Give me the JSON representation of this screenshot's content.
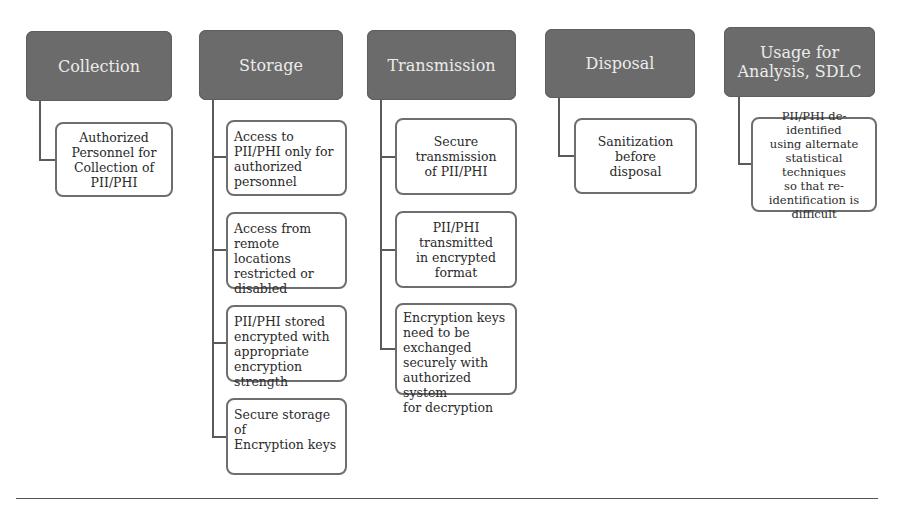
{
  "diagram": {
    "columns": [
      {
        "header": "Collection",
        "children": [
          "Authorized\nPersonnel for\nCollection of\nPII/PHI"
        ]
      },
      {
        "header": "Storage",
        "children": [
          "Access to\nPII/PHI only for\nauthorized\npersonnel",
          "Access from\nremote locations\nrestricted or\ndisabled",
          "PII/PHI stored\nencrypted with\nappropriate\nencryption\nstrength",
          "Secure storage of\nEncryption keys"
        ]
      },
      {
        "header": "Transmission",
        "children": [
          "Secure\ntransmission\nof PII/PHI",
          "PII/PHI\ntransmitted\nin encrypted\nformat",
          "Encryption keys\nneed to be\nexchanged\nsecurely with\nauthorized system\nfor decryption"
        ]
      },
      {
        "header": "Disposal",
        "children": [
          "Sanitization\nbefore\ndisposal"
        ]
      },
      {
        "header": "Usage for\nAnalysis, SDLC",
        "children": [
          "PII/PHI de-identified\nusing alternate\nstatistical techniques\nso that re-\nidentification is\ndifficult"
        ]
      }
    ],
    "colors": {
      "header_fill": "#6b6b6b",
      "header_text": "#ececec",
      "child_border": "#6e6e6e",
      "connector": "#5a5a5a",
      "background": "#ffffff"
    }
  }
}
